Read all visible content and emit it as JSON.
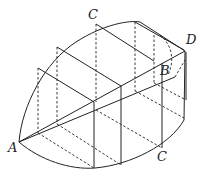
{
  "diagram": {
    "type": "3d-solid-cross-sections",
    "labels": {
      "A": "A",
      "B": "B",
      "C_top": "C",
      "C_bottom": "C",
      "D": "D"
    },
    "colors": {
      "stroke": "#222222",
      "background": "#ffffff"
    }
  }
}
